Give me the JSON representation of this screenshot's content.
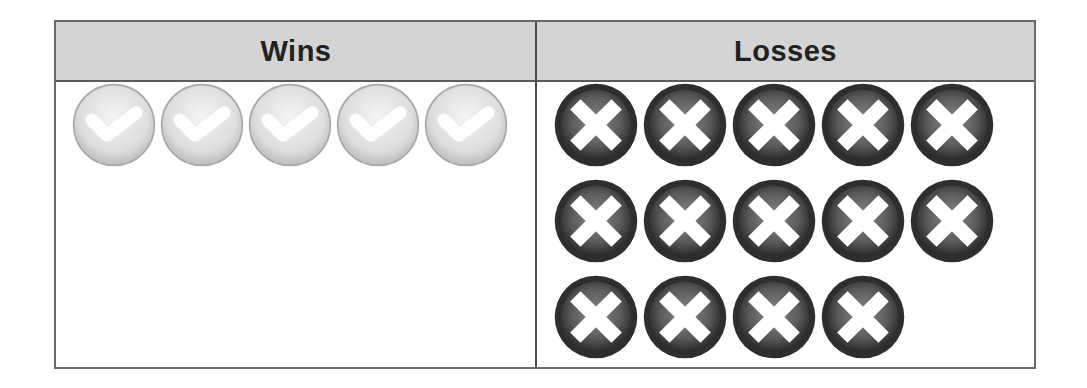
{
  "table": {
    "headers": {
      "wins": "Wins",
      "losses": "Losses"
    }
  },
  "colors": {
    "header_bg": "#d4d4d4",
    "border": "#5a5a5a",
    "win_icon": "#dcdcdc",
    "loss_icon": "#3a3a3a"
  },
  "icons": {
    "win": "check-circle-icon",
    "loss": "x-circle-icon"
  },
  "chart_data": {
    "type": "table",
    "title": "",
    "columns": [
      "Wins",
      "Losses"
    ],
    "values": {
      "Wins": 5,
      "Losses": 14
    },
    "layout": {
      "Wins": {
        "rows": [
          5
        ]
      },
      "Losses": {
        "rows": [
          5,
          5,
          4
        ]
      }
    },
    "representation": "pictograph: each icon = 1 game (check = win, X = loss)"
  }
}
